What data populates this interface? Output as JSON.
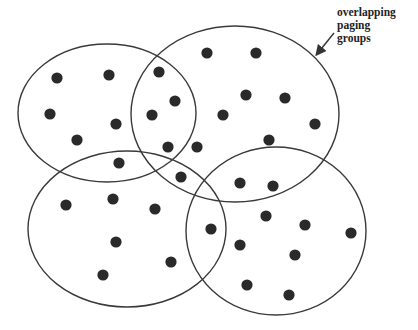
{
  "annotation": {
    "lines": [
      "overlapping",
      "paging",
      "groups"
    ]
  },
  "colors": {
    "stroke": "#3a3a3a",
    "dot": "#2a2a2a",
    "background": "#ffffff"
  },
  "groups": [
    {
      "name": "top-left-group",
      "cx": 107,
      "cy": 113,
      "rx": 89,
      "ry": 69
    },
    {
      "name": "top-right-group",
      "cx": 235,
      "cy": 114,
      "rx": 104,
      "ry": 88
    },
    {
      "name": "bottom-left-group",
      "cx": 127,
      "cy": 229,
      "rx": 99,
      "ry": 78
    },
    {
      "name": "bottom-right-group",
      "cx": 276,
      "cy": 231,
      "rx": 90,
      "ry": 84
    }
  ],
  "nodes": [
    [
      57,
      78
    ],
    [
      109,
      75
    ],
    [
      50,
      114
    ],
    [
      116,
      124
    ],
    [
      77,
      140
    ],
    [
      119,
      163
    ],
    [
      159,
      72
    ],
    [
      175,
      101
    ],
    [
      152,
      115
    ],
    [
      168,
      147
    ],
    [
      197,
      147
    ],
    [
      181,
      177
    ],
    [
      207,
      53
    ],
    [
      256,
      53
    ],
    [
      246,
      95
    ],
    [
      285,
      98
    ],
    [
      223,
      115
    ],
    [
      315,
      124
    ],
    [
      269,
      140
    ],
    [
      240,
      183
    ],
    [
      273,
      186
    ],
    [
      66,
      205
    ],
    [
      113,
      199
    ],
    [
      155,
      209
    ],
    [
      116,
      242
    ],
    [
      171,
      262
    ],
    [
      103,
      275
    ],
    [
      211,
      229
    ],
    [
      266,
      216
    ],
    [
      305,
      225
    ],
    [
      351,
      233
    ],
    [
      240,
      245
    ],
    [
      295,
      255
    ],
    [
      247,
      285
    ],
    [
      289,
      295
    ]
  ],
  "arrow": {
    "x1": 334,
    "y1": 33,
    "x2": 317,
    "y2": 54
  }
}
